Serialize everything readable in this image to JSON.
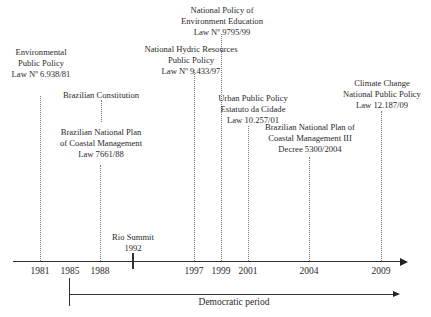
{
  "diagram": {
    "type": "timeline",
    "axis_years": [
      "1981",
      "1985",
      "1988",
      "1997",
      "1999",
      "2001",
      "2004",
      "2009"
    ],
    "events": [
      {
        "year": "1981",
        "lines": [
          "Environmental",
          "Public Policy",
          "Law Nº 6.938/81"
        ]
      },
      {
        "year": "1988",
        "lines": [
          "Brazilian Constitution"
        ]
      },
      {
        "year": "1988",
        "lines": [
          "Brazilian National Plan",
          "of Coastal Management",
          "Law 7661/88"
        ]
      },
      {
        "year": "1992",
        "lines": [
          "Rio Summit",
          "1992"
        ]
      },
      {
        "year": "1997",
        "lines": [
          "National Hydric Resources",
          "Public Policy",
          "Law Nº 9.433/97"
        ]
      },
      {
        "year": "1999",
        "lines": [
          "National Policy of",
          "Environment Education",
          "Law Nº 9795/99"
        ]
      },
      {
        "year": "2001",
        "lines": [
          "Urban Public Policy",
          "Estatuto da Cidade",
          "Law 10.257/01"
        ]
      },
      {
        "year": "2004",
        "lines": [
          "Brazilian National Plan of",
          "Coastal Management III",
          "Decree 5300/2004"
        ]
      },
      {
        "year": "2009",
        "lines": [
          "Climate Change",
          "National Public Policy",
          "Law 12.187/09"
        ]
      }
    ],
    "period": {
      "start": "1985",
      "label": "Democratic period"
    }
  },
  "colors": {
    "line": "#333333",
    "dotted": "#777777",
    "text": "#2a2a2a"
  }
}
